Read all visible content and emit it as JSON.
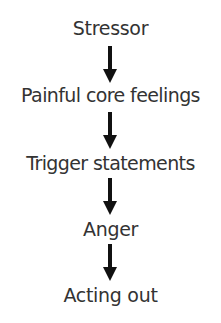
{
  "diagram": {
    "type": "vertical-flowchart",
    "nodes": [
      {
        "id": "stressor",
        "label": "Stressor"
      },
      {
        "id": "painful-core-feelings",
        "label": "Painful core feelings"
      },
      {
        "id": "trigger-statements",
        "label": "Trigger statements"
      },
      {
        "id": "anger",
        "label": "Anger"
      },
      {
        "id": "acting-out",
        "label": "Acting out"
      }
    ],
    "edges": [
      {
        "from": "stressor",
        "to": "painful-core-feelings",
        "style": "down-arrow"
      },
      {
        "from": "painful-core-feelings",
        "to": "trigger-statements",
        "style": "down-arrow"
      },
      {
        "from": "trigger-statements",
        "to": "anger",
        "style": "down-arrow"
      },
      {
        "from": "anger",
        "to": "acting-out",
        "style": "down-arrow"
      }
    ],
    "colors": {
      "text": "#333333",
      "arrow": "#111111",
      "background": "#ffffff"
    }
  }
}
